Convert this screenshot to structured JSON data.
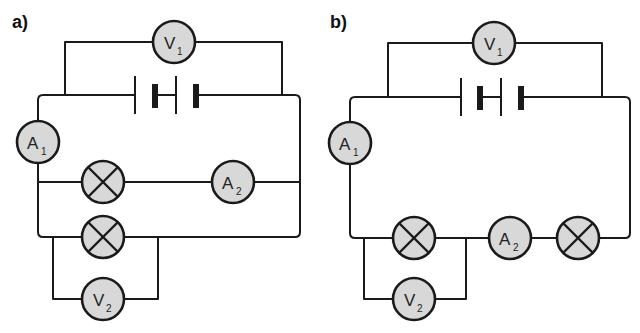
{
  "diagrams": [
    {
      "label": "a)",
      "description": "Battery with voltmeter V1 across it; ammeter A1 in main line; two parallel branches: lamp + ammeter A2, and lamp with voltmeter V2 across it",
      "components": {
        "V1": {
          "letter": "V",
          "sub": "1"
        },
        "A1": {
          "letter": "A",
          "sub": "1"
        },
        "A2": {
          "letter": "A",
          "sub": "2"
        },
        "V2": {
          "letter": "V",
          "sub": "2"
        },
        "lamps": 2
      }
    },
    {
      "label": "b)",
      "description": "Battery with voltmeter V1 across it; ammeter A1, lamp (with voltmeter V2 across it), ammeter A2 and second lamp all in series",
      "components": {
        "V1": {
          "letter": "V",
          "sub": "1"
        },
        "A1": {
          "letter": "A",
          "sub": "1"
        },
        "A2": {
          "letter": "A",
          "sub": "2"
        },
        "V2": {
          "letter": "V",
          "sub": "2"
        },
        "lamps": 2
      }
    }
  ],
  "colors": {
    "wire": "#1a1a1a",
    "component_fill": "#d8d8d8",
    "background": "#ffffff"
  }
}
